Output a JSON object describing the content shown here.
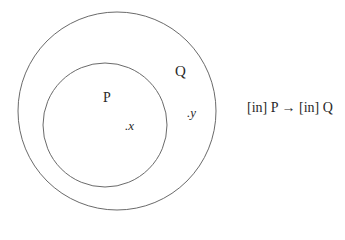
{
  "diagram": {
    "type": "venn-subset",
    "outer_set": {
      "label": "Q",
      "element": ".y"
    },
    "inner_set": {
      "label": "P",
      "element": ".x"
    },
    "caption": "[in] P → [in] Q"
  },
  "colors": {
    "stroke": "#6a6a6a",
    "text": "#2a2a2a",
    "background": "#ffffff"
  }
}
